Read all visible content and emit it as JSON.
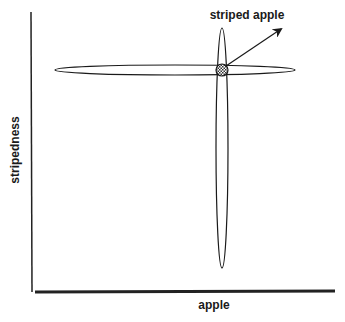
{
  "diagram": {
    "type": "concept-intersection",
    "axes": {
      "x_label": "apple",
      "y_label": "stripedness"
    },
    "annotation": {
      "label": "striped apple",
      "pointer": "arrow-icon"
    },
    "shapes": [
      {
        "name": "apple-ellipse",
        "orientation": "horizontal",
        "cx": 175,
        "cy": 70,
        "rx": 120,
        "ry": 5
      },
      {
        "name": "stripedness-ellipse",
        "orientation": "vertical",
        "cx": 222,
        "cy": 148,
        "rx": 6,
        "ry": 120
      },
      {
        "name": "intersection-marker",
        "pattern": "checkered",
        "cx": 222,
        "cy": 70,
        "r": 6
      }
    ],
    "colors": {
      "stroke": "#1a1a1a",
      "background": "#ffffff"
    }
  }
}
